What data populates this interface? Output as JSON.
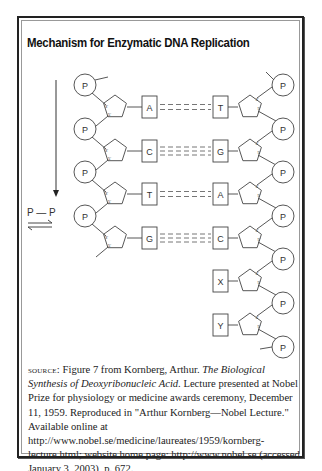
{
  "figure": {
    "title": "Mechanism for Enzymatic DNA Replication",
    "left_strand": {
      "phosphate_label": "P",
      "bases": [
        "A",
        "C",
        "T",
        "G"
      ]
    },
    "right_strand": {
      "phosphate_label": "P",
      "bases": [
        "T",
        "G",
        "A",
        "C",
        "X",
        "Y"
      ]
    },
    "sugar_labels": {
      "three_prime": "3'",
      "five_prime": "5'"
    },
    "reaction_label": "P — P",
    "reaction_arrow": "equilibrium",
    "direction_arrow": "down"
  },
  "caption": {
    "source_label": "SOURCE:",
    "text_1": " Figure 7 from Kornberg, Arthur. ",
    "title_italic": "The Biological Synthesis of Deoxyribonucleic Acid.",
    "text_2": " Lecture presented at Nobel Prize for physiology or medicine awards ceremony, December 11, 1959. Reproduced in \"Arthur Kornberg—Nobel Lecture.\" Available online at  http://www.nobel.se/medicine/laureates/1959/kornberg-lecture.html; website home page: http://www.nobel.se (accessed January 3, 2003), p. 672."
  }
}
